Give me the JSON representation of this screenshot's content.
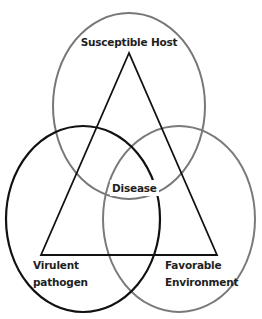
{
  "diagram": {
    "type": "venn-with-triangle",
    "labels": {
      "host": "Susceptible Host",
      "disease": "Disease",
      "pathogen_line1": "Virulent",
      "pathogen_line2": "pathogen",
      "environment_line1": "Favorable",
      "environment_line2": "Environment"
    },
    "circles": [
      {
        "id": "host",
        "label": "Susceptible Host",
        "cx": 129,
        "cy": 106,
        "rx": 76,
        "ry": 93,
        "stroke": "#777777"
      },
      {
        "id": "pathogen",
        "label": "Virulent pathogen",
        "cx": 83,
        "cy": 219,
        "rx": 77,
        "ry": 93,
        "stroke": "#111111"
      },
      {
        "id": "environment",
        "label": "Favorable Environment",
        "cx": 179,
        "cy": 219,
        "rx": 76,
        "ry": 93,
        "stroke": "#7a7a7a"
      }
    ],
    "triangle": {
      "apex": [
        129,
        53
      ],
      "base_left": [
        41,
        255
      ],
      "base_right": [
        217,
        255
      ],
      "stroke": "#111111"
    },
    "center_label": "Disease",
    "colors": {
      "background": "#ffffff",
      "text": "#1e1e1e",
      "dark_stroke": "#111111",
      "gray_stroke": "#777777"
    }
  }
}
